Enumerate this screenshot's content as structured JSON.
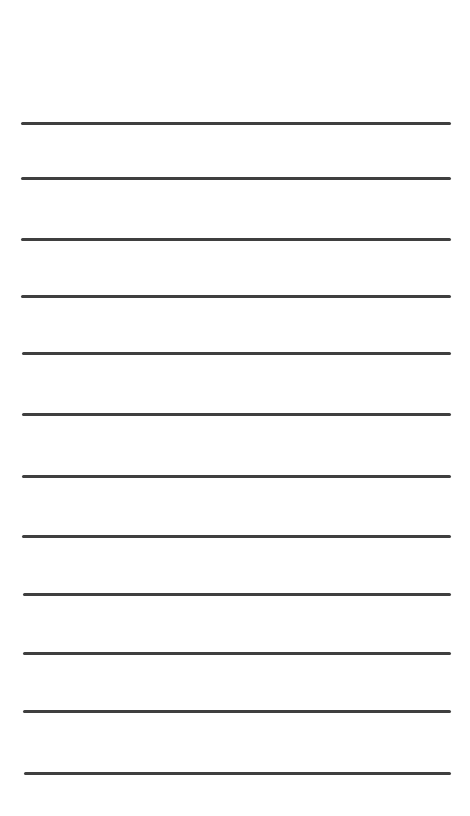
{
  "sheet": {
    "type": "ruled-lines",
    "background_color": "#ffffff",
    "line_color": "#3f3f3f",
    "line_thickness_px": 3,
    "lines": [
      {
        "y": 122,
        "x1": 21,
        "x2": 451
      },
      {
        "y": 177,
        "x1": 21,
        "x2": 451
      },
      {
        "y": 238,
        "x1": 21,
        "x2": 451
      },
      {
        "y": 295,
        "x1": 21,
        "x2": 451
      },
      {
        "y": 352,
        "x1": 22,
        "x2": 451
      },
      {
        "y": 413,
        "x1": 22,
        "x2": 451
      },
      {
        "y": 475,
        "x1": 22,
        "x2": 451
      },
      {
        "y": 535,
        "x1": 22,
        "x2": 451
      },
      {
        "y": 593,
        "x1": 23,
        "x2": 451
      },
      {
        "y": 652,
        "x1": 23,
        "x2": 451
      },
      {
        "y": 710,
        "x1": 23,
        "x2": 451
      },
      {
        "y": 772,
        "x1": 24,
        "x2": 451
      }
    ]
  }
}
